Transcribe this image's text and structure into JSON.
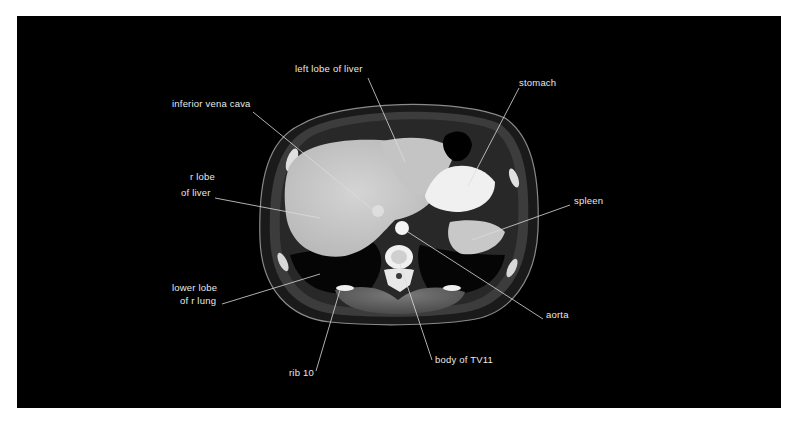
{
  "figure": {
    "background_color": "#000000",
    "page_color": "#ffffff"
  },
  "labels": [
    {
      "id": "left-lobe-of-liver",
      "text": "left lobe of liver",
      "x": 295,
      "y": 68
    },
    {
      "id": "inferior-vena-cava",
      "text": "inferior vena cava",
      "x": 172,
      "y": 103
    },
    {
      "id": "stomach",
      "text": "stomach",
      "x": 519,
      "y": 82
    },
    {
      "id": "r-lobe-of-liver-line1",
      "text": "r lobe",
      "x": 190,
      "y": 176
    },
    {
      "id": "r-lobe-of-liver-line2",
      "text": "of liver",
      "x": 181,
      "y": 192
    },
    {
      "id": "spleen",
      "text": "spleen",
      "x": 574,
      "y": 200
    },
    {
      "id": "lower-lobe-line1",
      "text": "lower lobe",
      "x": 172,
      "y": 287
    },
    {
      "id": "lower-lobe-line2",
      "text": "of r lung",
      "x": 180,
      "y": 300
    },
    {
      "id": "aorta",
      "text": "aorta",
      "x": 546,
      "y": 314
    },
    {
      "id": "body-of-tv11",
      "text": "body of TV11",
      "x": 435,
      "y": 359
    },
    {
      "id": "rib-10",
      "text": "rib 10",
      "x": 289,
      "y": 372
    }
  ]
}
